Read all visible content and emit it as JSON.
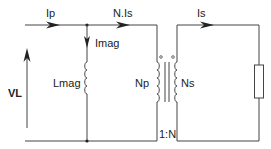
{
  "diagram": {
    "type": "transformer-equivalent-circuit",
    "labels": {
      "primary_current": "Ip",
      "referred_secondary_current": "N.Is",
      "secondary_current": "Is",
      "magnetizing_current": "Imag",
      "magnetizing_inductance": "Lmag",
      "load_voltage": "VL",
      "primary_turns": "Np",
      "secondary_turns": "Ns",
      "turns_ratio": "1:N"
    },
    "components": [
      {
        "id": "lmag",
        "kind": "inductor",
        "label": "Lmag"
      },
      {
        "id": "transformer",
        "kind": "ideal-transformer",
        "primary": "Np",
        "secondary": "Ns",
        "ratio": "1:N",
        "dots": true
      },
      {
        "id": "load",
        "kind": "resistor"
      }
    ],
    "colors": {
      "wire": "#444444",
      "text": "#222222",
      "background": "#ffffff"
    }
  }
}
